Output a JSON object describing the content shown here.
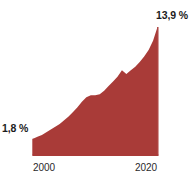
{
  "chart_data": {
    "type": "area",
    "title": "",
    "subtitle": "",
    "xlabel": "",
    "ylabel": "",
    "grid": false,
    "legend": null,
    "units": "%",
    "decimal_separator": ",",
    "fill_color": "#a93b38",
    "line_color": "#a93b38",
    "axis_color": "#a93b38",
    "label_color": "#1c1c1c",
    "background": "#ffffff",
    "xlim": [
      1995,
      2023
    ],
    "ylim": [
      0,
      14.6
    ],
    "x_ticks": [
      2000,
      2020
    ],
    "x_tick_labels": [
      "2000",
      "2020"
    ],
    "y_ticks": [],
    "y_tick_labels": [],
    "annotations": [
      {
        "name": "start-value",
        "text": "1,8 %",
        "x": 1995,
        "y": 1.8
      },
      {
        "name": "end-value",
        "text": "13,9 %",
        "x": 2023,
        "y": 13.9
      }
    ],
    "x": [
      1995,
      1996,
      1997,
      1998,
      1999,
      2000,
      2001,
      2002,
      2003,
      2004,
      2005,
      2006,
      2007,
      2008,
      2009,
      2010,
      2011,
      2012,
      2013,
      2014,
      2015,
      2016,
      2017,
      2018,
      2019,
      2020,
      2021,
      2022,
      2023
    ],
    "values": [
      1.8,
      2.0,
      2.2,
      2.5,
      2.8,
      3.1,
      3.4,
      3.8,
      4.2,
      4.7,
      5.2,
      5.8,
      6.3,
      6.5,
      6.5,
      6.6,
      7.0,
      7.5,
      8.0,
      8.5,
      9.2,
      8.8,
      9.2,
      9.6,
      10.1,
      10.7,
      11.4,
      12.4,
      13.9
    ],
    "series": [
      {
        "name": "value",
        "values": [
          1.8,
          2.0,
          2.2,
          2.5,
          2.8,
          3.1,
          3.4,
          3.8,
          4.2,
          4.7,
          5.2,
          5.8,
          6.3,
          6.5,
          6.5,
          6.6,
          7.0,
          7.5,
          8.0,
          8.5,
          9.2,
          8.8,
          9.2,
          9.6,
          10.1,
          10.7,
          11.4,
          12.4,
          13.9
        ]
      }
    ]
  },
  "labels": {
    "start": "1,8 %",
    "end": "13,9 %",
    "tick_first": "2000",
    "tick_last": "2020"
  }
}
